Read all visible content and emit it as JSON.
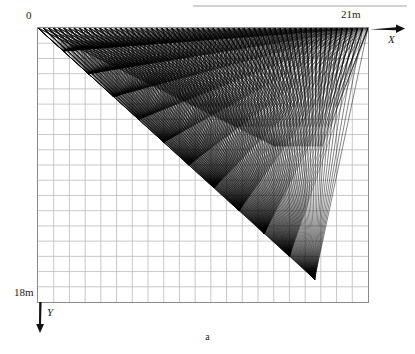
{
  "figure": {
    "caption": "a",
    "origin_label": "0",
    "x_axis": {
      "label": "X",
      "max_label": "21m",
      "arrow_icon": "arrow-right-icon",
      "units_m": 21
    },
    "y_axis": {
      "label": "Y",
      "max_label": "18m",
      "arrow_icon": "arrow-down-icon",
      "units_m": 18
    }
  },
  "chart_data": {
    "type": "line",
    "title": "a",
    "xlabel": "X",
    "ylabel": "Y",
    "xlim": [
      0,
      21
    ],
    "ylim": [
      0,
      18
    ],
    "x_tick_labels": [
      "0",
      "21m"
    ],
    "y_tick_labels": [
      "0",
      "18m"
    ],
    "grid": true,
    "grid_columns": 21,
    "grid_rows": 18,
    "grid_spacing_m": 1,
    "legend": "none",
    "source_line": {
      "y_m": 0,
      "x_start_m": 0,
      "x_end_m": 21,
      "count": 64
    },
    "focus_point": {
      "x_m": 17.6,
      "y_m": 16.5
    },
    "series": [
      {
        "name": "ray-fan-from-top-sources",
        "ray_count": 64,
        "color": "#000000"
      },
      {
        "name": "ray-fan-to-focus",
        "ray_count": 64,
        "color": "#000000"
      }
    ],
    "colors": {
      "rays": "#000000",
      "grid": "#b9b9bb",
      "frame": "#8a8a8c",
      "background": "#ffffff"
    }
  }
}
